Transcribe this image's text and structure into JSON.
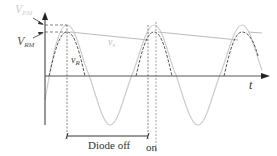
{
  "diagram": {
    "type": "waveform",
    "labels": {
      "v_peak_top": {
        "main": "V",
        "sub": "PM"
      },
      "v_rm": {
        "main": "V",
        "sub": "RM"
      },
      "v_s": "v",
      "v_s_sub": "s",
      "v_r": "v",
      "v_r_sub": "R",
      "t_axis": "t",
      "diode_off": "Diode off",
      "diode_on": "on"
    },
    "colors": {
      "axis": "#333333",
      "source_wave": "#cccccc",
      "rectified_wave": "#555555",
      "decay_line": "#bbbbbb",
      "guide_dash": "#666666",
      "faint_label": "#cfcfcf"
    }
  }
}
